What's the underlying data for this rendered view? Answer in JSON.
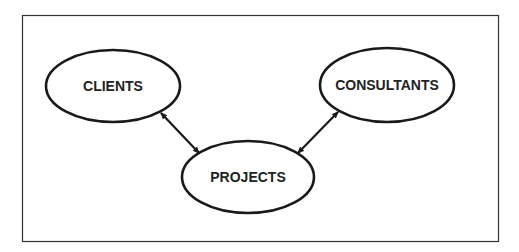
{
  "diagram": {
    "nodes": [
      {
        "id": "clients",
        "label": "CLIENTS",
        "cx": 113,
        "cy": 86,
        "rx": 67,
        "ry": 36
      },
      {
        "id": "consultants",
        "label": "CONSULTANTS",
        "cx": 387,
        "cy": 85,
        "rx": 67,
        "ry": 37
      },
      {
        "id": "projects",
        "label": "PROJECTS",
        "cx": 248,
        "cy": 177,
        "rx": 66,
        "ry": 36
      }
    ],
    "edges": [
      {
        "from": "clients",
        "to": "projects",
        "type": "bidirectional-arrow"
      },
      {
        "from": "consultants",
        "to": "projects",
        "type": "bidirectional-arrow"
      }
    ],
    "colors": {
      "stroke": "#1a1a1a",
      "background": "#ffffff",
      "text": "#222222"
    }
  }
}
